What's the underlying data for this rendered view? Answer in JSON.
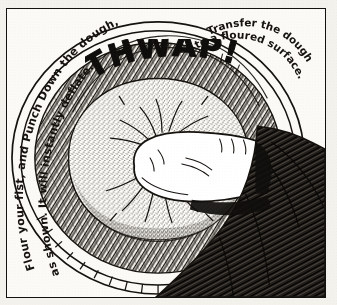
{
  "illustration": {
    "title": "Punch Down the Dough",
    "medium": "pen-and-ink hand-drawn cookbook illustration",
    "background_color": "#f4f2ec",
    "ink_color": "#16130f",
    "panel_border_color": "#141210"
  },
  "captions": {
    "left": {
      "line1": "Flour your fist, and Punch Down the dough,",
      "line2": "as shown. It will instantly deflate."
    },
    "right": {
      "line1": "Transfer the dough",
      "line2": "to a floured surface."
    }
  },
  "sound_effect": {
    "label": "THWAP!"
  },
  "scene": {
    "bowl_label": "mixing-bowl",
    "dough_label": "risen-dough",
    "fist_label": "floured-fist",
    "arm_label": "forearm-sleeve",
    "impact_label": "impact-lines"
  }
}
